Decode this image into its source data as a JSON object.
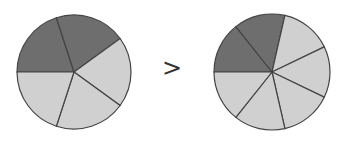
{
  "comparison": {
    "symbol": ">",
    "left_pie": {
      "slices": 5,
      "shaded": 2,
      "fraction": "2/5",
      "center": [
        74,
        72
      ],
      "radius": 57
    },
    "right_pie": {
      "slices": 7,
      "shaded": 2,
      "fraction": "2/7",
      "center": [
        272,
        72
      ],
      "radius": 58
    }
  },
  "colors": {
    "shaded": "#6e6e6e",
    "unshaded": "#d0d0d0",
    "stroke": "#444444"
  }
}
